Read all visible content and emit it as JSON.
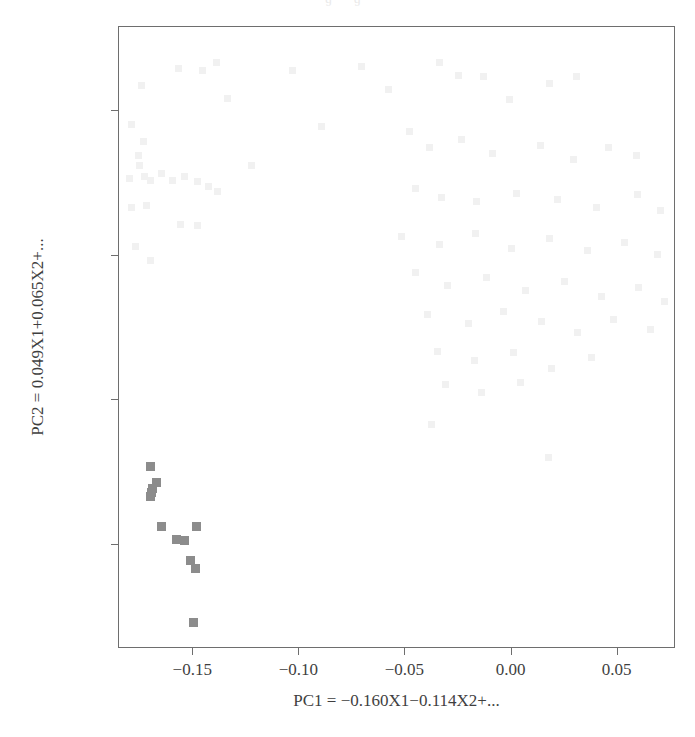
{
  "page": {
    "top_remnant_text": "’ · · ɡ · · ɡ ·",
    "background_color": "#ffffff"
  },
  "chart_data": {
    "type": "scatter",
    "title": "",
    "xlabel": "PC1 = −0.160X1−0.114X2+...",
    "ylabel": "PC2 = 0.049X1+0.065X2+...",
    "xlim": [
      -0.185,
      0.0775
    ],
    "ylim": [
      -0.272,
      0.158
    ],
    "xticks": [
      -0.15,
      -0.1,
      -0.05,
      0.0,
      0.05
    ],
    "xticklabels": [
      "−0.15",
      "−0.10",
      "−0.05",
      "0.00",
      "0.05"
    ],
    "yticks": [
      0.1,
      0.0,
      -0.1,
      -0.2
    ],
    "yticklabels": [
      "0.1",
      "0.0",
      "−0.1",
      "−0.2"
    ],
    "grid": false,
    "legend": null,
    "frame_color": "#6e6e6e",
    "marker": "square",
    "series": [
      {
        "name": "highlighted-cluster",
        "color": "#8c8c8c",
        "marker_size": 9,
        "points": [
          [
            -0.17,
            -0.1455
          ],
          [
            -0.1672,
            -0.1568
          ],
          [
            -0.169,
            -0.161
          ],
          [
            -0.1697,
            -0.164
          ],
          [
            -0.1702,
            -0.1665
          ],
          [
            -0.1652,
            -0.1876
          ],
          [
            -0.158,
            -0.1962
          ],
          [
            -0.1543,
            -0.197
          ],
          [
            -0.1487,
            -0.187
          ],
          [
            -0.1512,
            -0.2108
          ],
          [
            -0.149,
            -0.2163
          ],
          [
            -0.1498,
            -0.254
          ]
        ]
      },
      {
        "name": "background-faint",
        "color": "#f1f1f1",
        "marker_size": 7,
        "points": [
          [
            -0.157,
            0.1295
          ],
          [
            -0.1455,
            0.128
          ],
          [
            -0.139,
            0.1335
          ],
          [
            -0.1745,
            0.1175
          ],
          [
            -0.134,
            0.1085
          ],
          [
            -0.179,
            0.0905
          ],
          [
            -0.1735,
            0.079
          ],
          [
            -0.176,
            0.069
          ],
          [
            -0.1755,
            0.062
          ],
          [
            -0.18,
            0.0535
          ],
          [
            -0.173,
            0.0545
          ],
          [
            -0.17,
            0.052
          ],
          [
            -0.165,
            0.0565
          ],
          [
            -0.16,
            0.052
          ],
          [
            -0.154,
            0.0545
          ],
          [
            -0.148,
            0.0515
          ],
          [
            -0.143,
            0.048
          ],
          [
            -0.1385,
            0.0445
          ],
          [
            -0.179,
            0.033
          ],
          [
            -0.172,
            0.0345
          ],
          [
            -0.156,
            0.0215
          ],
          [
            -0.148,
            0.0205
          ],
          [
            -0.177,
            0.006
          ],
          [
            -0.17,
            -0.0035
          ],
          [
            -0.1225,
            0.0625
          ],
          [
            -0.103,
            0.128
          ],
          [
            -0.0895,
            0.089
          ],
          [
            -0.0705,
            0.1305
          ],
          [
            -0.058,
            0.115
          ],
          [
            -0.034,
            0.1335
          ],
          [
            -0.025,
            0.1245
          ],
          [
            -0.013,
            0.1235
          ],
          [
            -0.001,
            0.108
          ],
          [
            0.018,
            0.119
          ],
          [
            0.0305,
            0.1235
          ],
          [
            -0.048,
            0.0855
          ],
          [
            -0.0385,
            0.0745
          ],
          [
            -0.0235,
            0.08
          ],
          [
            -0.009,
            0.0705
          ],
          [
            0.0135,
            0.076
          ],
          [
            0.029,
            0.0665
          ],
          [
            0.0455,
            0.0745
          ],
          [
            0.059,
            0.069
          ],
          [
            -0.0455,
            0.0465
          ],
          [
            -0.033,
            0.04
          ],
          [
            -0.0165,
            0.0375
          ],
          [
            0.0025,
            0.043
          ],
          [
            0.0215,
            0.039
          ],
          [
            0.04,
            0.0335
          ],
          [
            0.0595,
            0.042
          ],
          [
            0.07,
            0.031
          ],
          [
            -0.052,
            0.013
          ],
          [
            -0.034,
            0.0075
          ],
          [
            -0.017,
            0.015
          ],
          [
            0.0,
            0.005
          ],
          [
            0.018,
            0.0115
          ],
          [
            0.036,
            0.0035
          ],
          [
            0.053,
            0.009
          ],
          [
            0.069,
            0.001
          ],
          [
            -0.0455,
            -0.012
          ],
          [
            -0.03,
            -0.0205
          ],
          [
            -0.012,
            -0.0155
          ],
          [
            0.0065,
            -0.0245
          ],
          [
            0.025,
            -0.018
          ],
          [
            0.0425,
            -0.0285
          ],
          [
            0.06,
            -0.022
          ],
          [
            0.072,
            -0.032
          ],
          [
            -0.0395,
            -0.0405
          ],
          [
            -0.0205,
            -0.047
          ],
          [
            -0.004,
            -0.0385
          ],
          [
            0.014,
            -0.0455
          ],
          [
            0.031,
            -0.053
          ],
          [
            0.048,
            -0.0445
          ],
          [
            0.0655,
            -0.051
          ],
          [
            -0.035,
            -0.0665
          ],
          [
            -0.0175,
            -0.0725
          ],
          [
            0.001,
            -0.067
          ],
          [
            0.019,
            -0.078
          ],
          [
            0.0375,
            -0.0705
          ],
          [
            -0.031,
            -0.089
          ],
          [
            -0.014,
            -0.0945
          ],
          [
            0.004,
            -0.088
          ],
          [
            -0.0375,
            -0.1165
          ],
          [
            0.0175,
            -0.1395
          ]
        ]
      }
    ]
  }
}
